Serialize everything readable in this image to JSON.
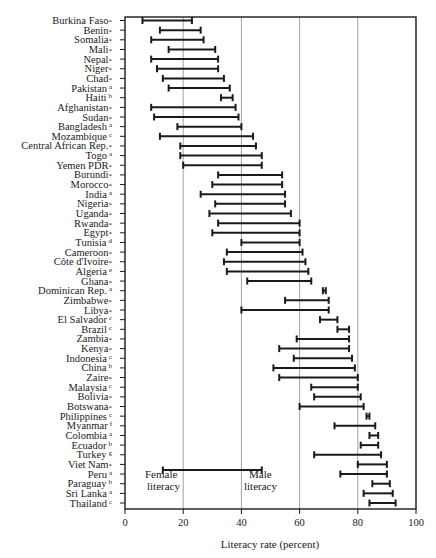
{
  "chart_data": {
    "type": "dumbbell-range",
    "title": "",
    "xlabel": "Literacy rate (percent)",
    "ylabel": "",
    "xlim": [
      0,
      100
    ],
    "xticks": [
      0,
      20,
      40,
      60,
      80,
      100
    ],
    "grid": {
      "vertical": true,
      "at": [
        20,
        40,
        60,
        80
      ]
    },
    "legend": {
      "position": "inside-lower-left",
      "female_label": "Female\nliteracy",
      "male_label": "Male\nliteracy",
      "female_value": 13,
      "male_value": 47
    },
    "series_names": [
      "Female literacy",
      "Male literacy"
    ],
    "categories": [
      {
        "name": "Burkina Faso",
        "note": "*",
        "female": 6,
        "male": 23
      },
      {
        "name": "Benin",
        "note": "*",
        "female": 12,
        "male": 26
      },
      {
        "name": "Somalia",
        "note": "*",
        "female": 9,
        "male": 27
      },
      {
        "name": "Mali",
        "note": "*",
        "female": 15,
        "male": 31
      },
      {
        "name": "Nepal",
        "note": "*",
        "female": 9,
        "male": 32
      },
      {
        "name": "Niger",
        "note": "*",
        "female": 11,
        "male": 32
      },
      {
        "name": "Chad",
        "note": "*",
        "female": 13,
        "male": 34
      },
      {
        "name": "Pakistan",
        "note": "a",
        "female": 15,
        "male": 36
      },
      {
        "name": "Haiti",
        "note": "b",
        "female": 33,
        "male": 37
      },
      {
        "name": "Afghanistan",
        "note": "*",
        "female": 9,
        "male": 38
      },
      {
        "name": "Sudan",
        "note": "*",
        "female": 10,
        "male": 39
      },
      {
        "name": "Bangladesh",
        "note": "a",
        "female": 18,
        "male": 40
      },
      {
        "name": "Mozambique",
        "note": "c",
        "female": 12,
        "male": 44
      },
      {
        "name": "Central African Rep.",
        "note": "*",
        "female": 19,
        "male": 45
      },
      {
        "name": "Togo",
        "note": "a",
        "female": 19,
        "male": 47
      },
      {
        "name": "Yemen PDR",
        "note": "*",
        "female": 20,
        "male": 47
      },
      {
        "name": "Burundi",
        "note": "*",
        "female": 32,
        "male": 54
      },
      {
        "name": "Morocco",
        "note": "*",
        "female": 30,
        "male": 54
      },
      {
        "name": "India",
        "note": "a",
        "female": 26,
        "male": 55
      },
      {
        "name": "Nigeria",
        "note": "*",
        "female": 31,
        "male": 55
      },
      {
        "name": "Uganda",
        "note": "*",
        "female": 29,
        "male": 57
      },
      {
        "name": "Rwanda",
        "note": "*",
        "female": 32,
        "male": 60
      },
      {
        "name": "Egypt",
        "note": "*",
        "female": 30,
        "male": 60
      },
      {
        "name": "Tunisia",
        "note": "d",
        "female": 40,
        "male": 60
      },
      {
        "name": "Cameroon",
        "note": "*",
        "female": 35,
        "male": 61
      },
      {
        "name": "Côte d'Ivoire",
        "note": "*",
        "female": 34,
        "male": 62
      },
      {
        "name": "Algeria",
        "note": "e",
        "female": 35,
        "male": 63
      },
      {
        "name": "Ghana",
        "note": "*",
        "female": 42,
        "male": 64
      },
      {
        "name": "Dominican Rep.",
        "note": "a",
        "female": 68,
        "male": 69
      },
      {
        "name": "Zimbabwe",
        "note": "*",
        "female": 55,
        "male": 70
      },
      {
        "name": "Libya",
        "note": "*",
        "female": 40,
        "male": 70
      },
      {
        "name": "El Salvador",
        "note": "c",
        "female": 67,
        "male": 73
      },
      {
        "name": "Brazil",
        "note": "c",
        "female": 73,
        "male": 77
      },
      {
        "name": "Zambia",
        "note": "*",
        "female": 59,
        "male": 77
      },
      {
        "name": "Kenya",
        "note": "*",
        "female": 53,
        "male": 77
      },
      {
        "name": "Indonesia",
        "note": "c",
        "female": 58,
        "male": 78
      },
      {
        "name": "China",
        "note": "b",
        "female": 51,
        "male": 79
      },
      {
        "name": "Zaire",
        "note": "*",
        "female": 53,
        "male": 80
      },
      {
        "name": "Malaysia",
        "note": "c",
        "female": 64,
        "male": 80
      },
      {
        "name": "Bolivia",
        "note": "*",
        "female": 65,
        "male": 81
      },
      {
        "name": "Botswana",
        "note": "*",
        "female": 60,
        "male": 82
      },
      {
        "name": "Philippines",
        "note": "c",
        "female": 83,
        "male": 84
      },
      {
        "name": "Myanmar",
        "note": "f",
        "female": 72,
        "male": 86
      },
      {
        "name": "Colombia",
        "note": "a",
        "female": 84,
        "male": 87
      },
      {
        "name": "Ecuador",
        "note": "b",
        "female": 81,
        "male": 87
      },
      {
        "name": "Turkey",
        "note": "g",
        "female": 65,
        "male": 88
      },
      {
        "name": "Viet Nam",
        "note": "*",
        "female": 80,
        "male": 90
      },
      {
        "name": "Peru",
        "note": "a",
        "female": 74,
        "male": 90
      },
      {
        "name": "Paraguay",
        "note": "b",
        "female": 85,
        "male": 91
      },
      {
        "name": "Sri Lanka",
        "note": "a",
        "female": 82,
        "male": 92
      },
      {
        "name": "Thailand",
        "note": "c",
        "female": 84,
        "male": 93
      }
    ]
  },
  "axis": {
    "x_title": "Literacy rate (percent)",
    "ticks": [
      "0",
      "20",
      "40",
      "60",
      "80",
      "100"
    ]
  },
  "legend": {
    "female_line1": "Female",
    "female_line2": "literacy",
    "male_line1": "Male",
    "male_line2": "literacy"
  },
  "colors": {
    "ink": "#1a1a1a",
    "grid": "#8a8a8a",
    "background": "#ffffff"
  }
}
